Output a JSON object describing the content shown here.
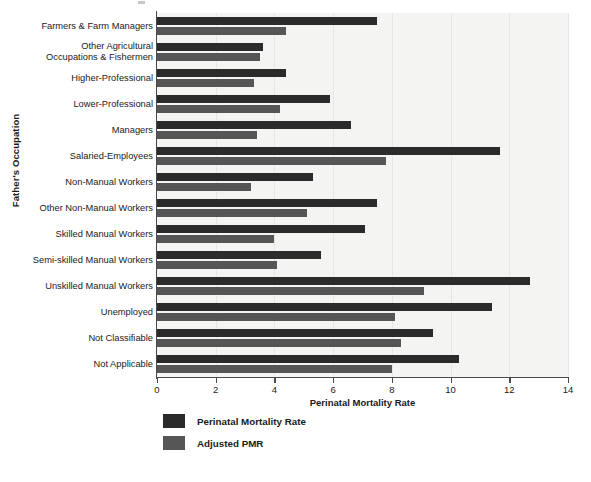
{
  "chart_data": {
    "type": "bar",
    "orientation": "horizontal",
    "title": "",
    "xlabel": "Perinatal Mortality Rate",
    "ylabel": "Father's Occupation",
    "xlim": [
      0,
      14
    ],
    "xticks": [
      0,
      2,
      4,
      6,
      8,
      10,
      12,
      14
    ],
    "xticklabels": [
      "0",
      "2",
      "4",
      "6",
      "8",
      "10",
      "12",
      "14"
    ],
    "grid": true,
    "legend_position": "below-axes-left",
    "categories": [
      "Farmers & Farm Managers",
      "Other Agricultural\nOccupations & Fishermen",
      "Higher-Professional",
      "Lower-Professional",
      "Managers",
      "Salaried-Employees",
      "Non-Manual Workers",
      "Other Non-Manual Workers",
      "Skilled Manual Workers",
      "Semi-skilled Manual Workers",
      "Unskilled Manual Workers",
      "Unemployed",
      "Not Classifiable",
      "Not Applicable"
    ],
    "series": [
      {
        "name": "Perinatal Mortality Rate",
        "color": "#2b2b2b",
        "values": [
          7.5,
          3.6,
          4.4,
          5.9,
          6.6,
          11.7,
          5.3,
          7.5,
          7.1,
          5.6,
          12.7,
          11.4,
          9.4,
          10.3
        ]
      },
      {
        "name": "Adjusted PMR",
        "color": "#565656",
        "values": [
          4.4,
          3.5,
          3.3,
          4.2,
          3.4,
          7.8,
          3.2,
          5.1,
          4.0,
          4.1,
          9.1,
          8.1,
          8.3,
          8.0
        ]
      }
    ]
  },
  "legend": {
    "items": [
      {
        "label": "Perinatal Mortality Rate",
        "swatch": "pmr"
      },
      {
        "label": "Adjusted PMR",
        "swatch": "adj"
      }
    ]
  },
  "colors": {
    "pmr": "#2b2b2b",
    "adjusted_pmr": "#565656",
    "plot_background": "#f4f4f2",
    "axis": "#4a4a4a",
    "text": "#1a1a1a"
  }
}
